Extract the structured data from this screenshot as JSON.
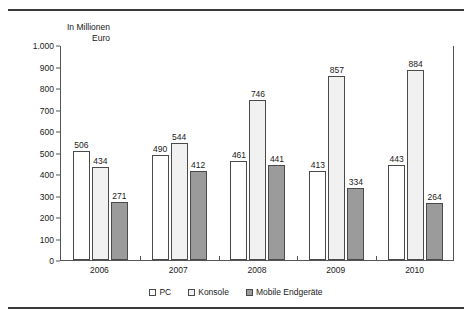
{
  "chart_data": {
    "type": "bar",
    "title": "",
    "subtitle": "",
    "axis_caption": "In Millionen\nEuro",
    "xlabel": "",
    "ylabel": "",
    "categories": [
      "2006",
      "2007",
      "2008",
      "2009",
      "2010"
    ],
    "series": [
      {
        "name": "PC",
        "values": [
          506,
          490,
          461,
          413,
          443
        ],
        "fill": "white",
        "color": "#ffffff"
      },
      {
        "name": "Konsole",
        "values": [
          434,
          544,
          746,
          857,
          884
        ],
        "fill": "light-dotted",
        "color": "#f1f1f1"
      },
      {
        "name": "Mobile Endgeräte",
        "values": [
          271,
          412,
          441,
          334,
          264
        ],
        "fill": "dark-gray",
        "color": "#9b9b9b"
      }
    ],
    "ylim": [
      0,
      1000
    ],
    "yticks": [
      0,
      100,
      200,
      300,
      400,
      500,
      600,
      700,
      800,
      900,
      1000
    ],
    "ytick_labels": [
      "0",
      "100",
      "200",
      "300",
      "400",
      "500",
      "600",
      "700",
      "800",
      "900",
      "1.000"
    ],
    "grid": false,
    "legend_position": "bottom",
    "data_labels": true
  },
  "legend": {
    "items": [
      {
        "label": "PC",
        "swatch": "pc"
      },
      {
        "label": "Konsole",
        "swatch": "konsole"
      },
      {
        "label": "Mobile Endgeräte",
        "swatch": "mobile"
      }
    ]
  }
}
